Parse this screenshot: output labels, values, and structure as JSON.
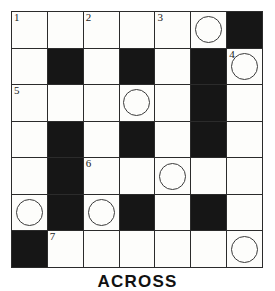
{
  "puzzle": {
    "type": "crossword-grid",
    "rows": 7,
    "cols": 7,
    "colors": {
      "block": "#161616",
      "open": "#fdfdfb",
      "gridline": "#2b2b2b",
      "circle_stroke": "#3a3a3a",
      "number_text": "#1a1a1a"
    },
    "cells": [
      [
        {
          "block": false,
          "number": "1",
          "circle": false
        },
        {
          "block": false,
          "number": "",
          "circle": false
        },
        {
          "block": false,
          "number": "2",
          "circle": false
        },
        {
          "block": false,
          "number": "",
          "circle": false
        },
        {
          "block": false,
          "number": "3",
          "circle": false
        },
        {
          "block": false,
          "number": "",
          "circle": true
        },
        {
          "block": true,
          "number": "",
          "circle": false
        }
      ],
      [
        {
          "block": false,
          "number": "",
          "circle": false
        },
        {
          "block": true,
          "number": "",
          "circle": false
        },
        {
          "block": false,
          "number": "",
          "circle": false
        },
        {
          "block": true,
          "number": "",
          "circle": false
        },
        {
          "block": false,
          "number": "",
          "circle": false
        },
        {
          "block": true,
          "number": "",
          "circle": false
        },
        {
          "block": false,
          "number": "4",
          "circle": true
        }
      ],
      [
        {
          "block": false,
          "number": "5",
          "circle": false
        },
        {
          "block": false,
          "number": "",
          "circle": false
        },
        {
          "block": false,
          "number": "",
          "circle": false
        },
        {
          "block": false,
          "number": "",
          "circle": true
        },
        {
          "block": false,
          "number": "",
          "circle": false
        },
        {
          "block": true,
          "number": "",
          "circle": false
        },
        {
          "block": false,
          "number": "",
          "circle": false
        }
      ],
      [
        {
          "block": false,
          "number": "",
          "circle": false
        },
        {
          "block": true,
          "number": "",
          "circle": false
        },
        {
          "block": false,
          "number": "",
          "circle": false
        },
        {
          "block": true,
          "number": "",
          "circle": false
        },
        {
          "block": false,
          "number": "",
          "circle": false
        },
        {
          "block": true,
          "number": "",
          "circle": false
        },
        {
          "block": false,
          "number": "",
          "circle": false
        }
      ],
      [
        {
          "block": false,
          "number": "",
          "circle": false
        },
        {
          "block": true,
          "number": "",
          "circle": false
        },
        {
          "block": false,
          "number": "6",
          "circle": false
        },
        {
          "block": false,
          "number": "",
          "circle": false
        },
        {
          "block": false,
          "number": "",
          "circle": true
        },
        {
          "block": false,
          "number": "",
          "circle": false
        },
        {
          "block": false,
          "number": "",
          "circle": false
        }
      ],
      [
        {
          "block": false,
          "number": "",
          "circle": true
        },
        {
          "block": true,
          "number": "",
          "circle": false
        },
        {
          "block": false,
          "number": "",
          "circle": true
        },
        {
          "block": true,
          "number": "",
          "circle": false
        },
        {
          "block": false,
          "number": "",
          "circle": false
        },
        {
          "block": true,
          "number": "",
          "circle": false
        },
        {
          "block": false,
          "number": "",
          "circle": false
        }
      ],
      [
        {
          "block": true,
          "number": "",
          "circle": false
        },
        {
          "block": false,
          "number": "7",
          "circle": false
        },
        {
          "block": false,
          "number": "",
          "circle": false
        },
        {
          "block": false,
          "number": "",
          "circle": false
        },
        {
          "block": false,
          "number": "",
          "circle": false
        },
        {
          "block": false,
          "number": "",
          "circle": false
        },
        {
          "block": false,
          "number": "",
          "circle": true
        }
      ]
    ]
  },
  "clues": {
    "across_heading": "ACROSS"
  }
}
